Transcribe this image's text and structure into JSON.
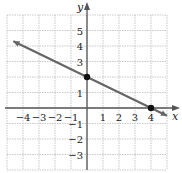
{
  "chart_data": {
    "type": "line",
    "title": "",
    "xlabel": "x",
    "ylabel": "y",
    "xlim": [
      -5,
      5
    ],
    "ylim": [
      -4,
      6
    ],
    "grid": true,
    "x_ticks": [
      "-4",
      "-3",
      "-2",
      "-1",
      "1",
      "2",
      "3",
      "4"
    ],
    "y_ticks": [
      "5",
      "4",
      "3",
      "1",
      "-1",
      "-2",
      "-3"
    ],
    "series": [
      {
        "name": "line",
        "equation": "y = -x/2 + 2",
        "slope": -0.5,
        "intercept": 2,
        "x": [
          -4.6,
          5
        ],
        "y": [
          4.3,
          -0.5
        ]
      }
    ],
    "points": [
      {
        "label": "y-intercept",
        "x": 0,
        "y": 2
      },
      {
        "label": "x-intercept",
        "x": 4,
        "y": 0
      }
    ],
    "colors": {
      "line": "#666666",
      "grid": "#c8c8c8",
      "axis": "#555555",
      "point": "#111111"
    }
  }
}
